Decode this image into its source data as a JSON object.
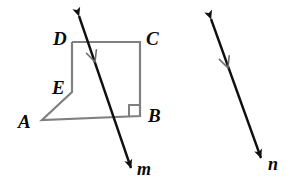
{
  "figure": {
    "background_color": "#ffffff",
    "shape_stroke_color": "#808080",
    "line_stroke_color": "#101010",
    "label_color": "#0a0a0a"
  },
  "vertex_labels": [
    {
      "id": "D",
      "text": "D",
      "x": 53,
      "y": 29
    },
    {
      "id": "C",
      "text": "C",
      "x": 146,
      "y": 29
    },
    {
      "id": "E",
      "text": "E",
      "x": 52,
      "y": 78
    },
    {
      "id": "B",
      "text": "B",
      "x": 148,
      "y": 106
    },
    {
      "id": "A",
      "text": "A",
      "x": 18,
      "y": 112
    }
  ],
  "line_labels": [
    {
      "id": "m",
      "text": "m",
      "x": 137,
      "y": 160
    },
    {
      "id": "n",
      "text": "n",
      "x": 268,
      "y": 155
    }
  ],
  "polygon": {
    "name": "quadrilateral-ABCDE",
    "points": "72,42 140,42 140,116 42,120 72,92",
    "right_angle_marker": {
      "corner": "B",
      "size": 10
    }
  },
  "lines": [
    {
      "id": "m",
      "name": "line-m",
      "x1": 79,
      "y1": 16,
      "x2": 131,
      "y2": 168,
      "arrow_start": true,
      "arrow_end": true,
      "tick_mark": {
        "x": 95,
        "y": 62
      }
    },
    {
      "id": "n",
      "name": "line-n",
      "x1": 211,
      "y1": 19,
      "x2": 261,
      "y2": 158,
      "arrow_start": true,
      "arrow_end": true,
      "tick_mark": {
        "x": 228,
        "y": 68
      }
    }
  ],
  "chart_data": {
    "type": "diagram",
    "elements": {
      "points": [
        "A",
        "B",
        "C",
        "D",
        "E"
      ],
      "lines": [
        "m",
        "n"
      ],
      "right_angles": [
        "B"
      ],
      "parallel_marks": [
        "m",
        "n"
      ]
    }
  }
}
